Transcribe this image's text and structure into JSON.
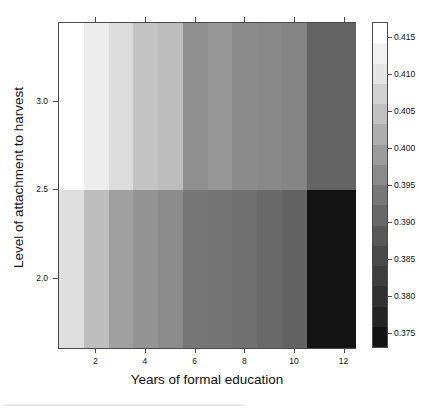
{
  "chart_data": {
    "type": "heatmap",
    "title": "",
    "xlabel": "Years of formal education",
    "ylabel": "Level of attachment to harvest",
    "x": [
      1,
      2,
      3,
      4,
      5,
      6,
      7,
      8,
      9,
      10,
      11,
      12
    ],
    "y": [
      2.0,
      3.0
    ],
    "xlim": [
      0.5,
      12.5
    ],
    "ylim": [
      1.6,
      3.45
    ],
    "xticks": [
      2,
      4,
      6,
      8,
      10,
      12
    ],
    "xticklabels": [
      "2",
      "4",
      "6",
      "8",
      "10",
      "12"
    ],
    "yticks": [
      2.0,
      2.5,
      3.0
    ],
    "yticklabels": [
      "2.0",
      "2.5",
      "3.0"
    ],
    "grid": false,
    "colormap": "grayscale",
    "colorbar": {
      "position": "right",
      "vmin": 0.373,
      "vmax": 0.417,
      "ticks": [
        0.375,
        0.38,
        0.385,
        0.39,
        0.395,
        0.4,
        0.405,
        0.41,
        0.415
      ],
      "ticklabels": [
        "0.375",
        "0.380",
        "0.385",
        "0.390",
        "0.395",
        "0.400",
        "0.405",
        "0.410",
        "0.415"
      ],
      "bands": [
        "#121212",
        "#242424",
        "#313131",
        "#3d3d3d",
        "#4a4a4a",
        "#585858",
        "#676767",
        "#787878",
        "#8a8a8a",
        "#9c9c9c",
        "#aeaeae",
        "#c0c0c0",
        "#d2d2d2",
        "#e4e4e4",
        "#f2f2f2",
        "#ffffff"
      ]
    },
    "rows": [
      {
        "row_label": "upper (attachment > 2.5)",
        "y_range": [
          2.5,
          3.45
        ],
        "values": [
          0.417,
          0.4125,
          0.409,
          0.405,
          0.4035,
          0.3975,
          0.3985,
          0.3965,
          0.3955,
          0.3945,
          0.389,
          0.389
        ],
        "colors": [
          "#ffffff",
          "#ededed",
          "#dcdcdc",
          "#c3c3c3",
          "#bdbdbd",
          "#8f8f8f",
          "#969696",
          "#8b8b8b",
          "#888888",
          "#858585",
          "#646464",
          "#646464"
        ]
      },
      {
        "row_label": "lower (attachment < 2.5)",
        "y_range": [
          1.6,
          2.5
        ],
        "values": [
          0.41,
          0.4035,
          0.3985,
          0.396,
          0.394,
          0.39,
          0.3895,
          0.3885,
          0.387,
          0.3855,
          0.374,
          0.374
        ],
        "colors": [
          "#dfdfdf",
          "#bebebe",
          "#a0a0a0",
          "#949494",
          "#8c8c8c",
          "#767676",
          "#747474",
          "#707070",
          "#6a6a6a",
          "#636363",
          "#131313",
          "#131313"
        ]
      }
    ]
  },
  "axes": {
    "x_title": "Years of formal education",
    "y_title": "Level of attachment to harvest"
  }
}
